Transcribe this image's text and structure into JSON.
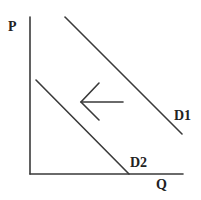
{
  "diagram": {
    "axes": {
      "y_label": "P",
      "x_label": "Q"
    },
    "curves": [
      {
        "id": "D1",
        "label": "D1",
        "role": "original demand"
      },
      {
        "id": "D2",
        "label": "D2",
        "role": "new demand (shifted left)"
      }
    ],
    "arrow": {
      "direction": "left",
      "meaning": "decrease in demand"
    },
    "colors": {
      "line": "#3a3a3a",
      "text": "#222222",
      "background": "#ffffff"
    }
  }
}
